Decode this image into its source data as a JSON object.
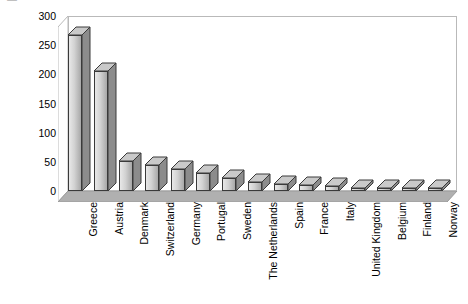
{
  "chart_data": {
    "type": "bar",
    "title": "",
    "subtitle": "",
    "xlabel": "",
    "ylabel": "[m² / 1000 inhabitants]",
    "ylabel_prefix": "[m",
    "ylabel_sup": "2",
    "ylabel_suffix": " / 1000 inhabitants]",
    "ylim": [
      0,
      300
    ],
    "ytick_values": [
      0,
      50,
      100,
      150,
      200,
      250,
      300
    ],
    "ytick_labels": [
      "0",
      "50",
      "100",
      "150",
      "200",
      "250",
      "300"
    ],
    "grid": false,
    "legend": false,
    "legend_position": "none",
    "style_3d": true,
    "categories": [
      "Greece",
      "Austria",
      "Denmark",
      "Switzerland",
      "Germany",
      "Portugal",
      "Sweden",
      "The Netherlands",
      "Spain",
      "France",
      "Italy",
      "United Kingdom",
      "Belgium",
      "Finland",
      "Norway"
    ],
    "values": [
      268,
      205,
      52,
      44,
      38,
      30,
      22,
      16,
      12,
      11,
      9,
      5,
      4,
      3,
      3
    ],
    "series": [
      {
        "name": "",
        "values": [
          268,
          205,
          52,
          44,
          38,
          30,
          22,
          16,
          12,
          11,
          9,
          5,
          4,
          3,
          3
        ]
      }
    ]
  },
  "colors": {
    "background": "#ffffff",
    "plot_area": "#ffffff",
    "frame_line": "#b9b9b9",
    "floor_band": "#b0b0b0",
    "bar_face_light": "#e8e8e8",
    "bar_face_dark": "#a8a8a8",
    "bar_side": "#8c8c8c",
    "bar_top": "#c9c9c9",
    "bar_outline": "#3a3a3a",
    "text": "#000000"
  }
}
